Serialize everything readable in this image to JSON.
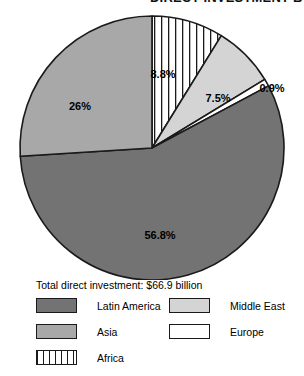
{
  "title": {
    "text": "DIRECT INVESTMENT BY REGION 1995",
    "cropped": true
  },
  "legend": {
    "total_label": "Total direct investment:",
    "total_value": "$66.9 billion",
    "total_line": "Total direct investment:  $66.9 billion",
    "entries": [
      {
        "label": "Latin America",
        "swatch": "dark-gray",
        "color": "#737373",
        "column": "left",
        "row": 1
      },
      {
        "label": "Asia",
        "swatch": "medium-gray",
        "color": "#a8a8a8",
        "column": "left",
        "row": 2
      },
      {
        "label": "Africa",
        "swatch": "striped",
        "color": "#ffffff",
        "column": "left",
        "row": 3
      },
      {
        "label": "Middle East",
        "swatch": "light-gray",
        "color": "#d4d4d4",
        "column": "right",
        "row": 1
      },
      {
        "label": "Europe",
        "swatch": "white",
        "color": "#ffffff",
        "column": "right",
        "row": 2
      }
    ]
  },
  "chart_data": {
    "type": "pie",
    "title": "DIRECT INVESTMENT BY REGION 1995",
    "total": "$66.9 billion",
    "start_angle_deg": 0,
    "direction": "clockwise",
    "categories": [
      "Africa",
      "Middle East",
      "Europe",
      "Latin America",
      "Asia"
    ],
    "values": [
      8.8,
      7.5,
      0.9,
      56.8,
      26.0
    ],
    "labels": [
      "8.8%",
      "7.5%",
      "0.9%",
      "56.8%",
      "26%"
    ],
    "colors": [
      "#ffffff",
      "#d4d4d4",
      "#ffffff",
      "#737373",
      "#a8a8a8"
    ],
    "patterns": [
      "vertical-stripes",
      "solid",
      "solid",
      "solid",
      "solid"
    ],
    "label_positions": [
      {
        "name": "Africa",
        "text": "8.8%",
        "x": 163,
        "y": 70,
        "inside": true
      },
      {
        "name": "Middle East",
        "text": "7.5%",
        "x": 218,
        "y": 94,
        "inside": true
      },
      {
        "name": "Europe",
        "text": "0.9%",
        "x": 272,
        "y": 84,
        "inside": false
      },
      {
        "name": "Latin America",
        "text": "56.8%",
        "x": 160,
        "y": 231,
        "inside": true
      },
      {
        "name": "Asia",
        "text": "26%",
        "x": 80,
        "y": 102,
        "inside": true
      }
    ],
    "legend_position": "bottom",
    "grid": false,
    "xlabel": "",
    "ylabel": ""
  },
  "geometry": {
    "center_x": 152,
    "center_y": 140,
    "radius": 132,
    "stroke": "#1a1a1a"
  }
}
